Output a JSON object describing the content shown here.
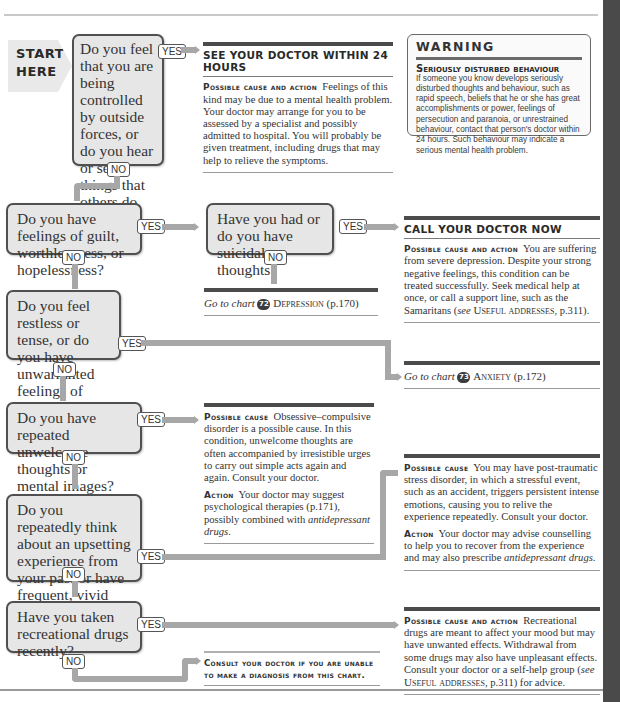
{
  "start": {
    "line1": "START",
    "line2": "HERE"
  },
  "labels": {
    "yes": "YES",
    "no": "NO"
  },
  "questions": [
    {
      "id": "q1",
      "text": "Do you feel that you are being controlled by outside forces, or do you hear or see things that others do not?"
    },
    {
      "id": "q2",
      "text": "Do you have feelings of guilt, worthlessness, or hopelessness?"
    },
    {
      "id": "q2b",
      "text": "Have you had or do you have suicidal thoughts?"
    },
    {
      "id": "q3",
      "text": "Do you feel restless or tense, or do you have unwarranted feelings of foreboding?"
    },
    {
      "id": "q4",
      "text": "Do you have repeated unwelcome thoughts or mental images?"
    },
    {
      "id": "q5",
      "text": "Do you repeatedly think about an upsetting experience from your past or have frequent, vivid dreams about it?"
    },
    {
      "id": "q6",
      "text": "Have you taken recreational drugs recently?"
    }
  ],
  "results": {
    "r1": {
      "heading": "SEE YOUR DOCTOR WITHIN 24 HOURS",
      "label": "Possible cause and action",
      "text": "Feelings of this kind may be due to a mental health problem. Your doctor may arrange for you to be assessed by a specialist and possibly admitted to hospital. You will probably be given treatment, including drugs that may help to relieve the symptoms."
    },
    "r2": {
      "heading": "CALL YOUR DOCTOR NOW",
      "label": "Possible cause and action",
      "text": "You are suffering from severe depression. Despite your strong negative feelings, this condition can be treated successfully. Seek medical help at once, or call a support line, such as the Samaritans (",
      "see": "see",
      "ref": "Useful addresses",
      "ref_page": ", p.311)."
    },
    "depression": {
      "prefix": "Go to chart",
      "number": "72",
      "title": "Depression",
      "page": "(p.170)"
    },
    "anxiety": {
      "prefix": "Go to chart",
      "number": "73",
      "title": "Anxiety",
      "page": "(p.172)"
    },
    "ocd": {
      "label1": "Possible cause",
      "text1": "Obsessive–compulsive disorder is a possible cause. In this condition, unwelcome thoughts are often accompanied by irresistible urges to carry out simple acts again and again. Consult your doctor.",
      "label2": "Action",
      "text2": "Your doctor may suggest psychological therapies (p.171), possibly combined with",
      "em": "antidepressant drugs",
      "end": "."
    },
    "ptsd": {
      "label1": "Possible cause",
      "text1": "You may have post-traumatic stress disorder, in which a stressful event, such as an accident, triggers persistent intense emotions, causing you to relive the experience repeatedly. Consult your doctor.",
      "label2": "Action",
      "text2": "Your doctor may advise counselling to help you to recover from the experience and may also prescribe",
      "em": "antidepressant drugs",
      "end": "."
    },
    "drugs": {
      "label": "Possible cause and action",
      "text": "Recreational drugs are meant to affect your mood but may have unwanted effects. Withdrawal from some drugs may also have unpleasant effects. Consult your doctor or a self-help group (",
      "see": "see",
      "ref": "Useful addresses",
      "ref_page": ", p.311) for advice."
    },
    "consult": {
      "text": "Consult your doctor if you are unable to make a diagnosis from this chart."
    }
  },
  "warning": {
    "title": "WARNING",
    "subtitle": "Seriously disturbed behaviour",
    "text": "If someone you know develops seriously disturbed thoughts and behaviour, such as rapid speech, beliefs that he or she has great accomplishments or power, feelings of persecution and paranoia, or unrestrained behaviour, contact that person's doctor within 24 hours. Such behaviour may indicate a serious mental health problem."
  },
  "colors": {
    "question_fill": "#e6e6e6",
    "arrow": "#a7a7a7",
    "rule": "#4b4b4b",
    "right_band": "#4a4a4a"
  }
}
